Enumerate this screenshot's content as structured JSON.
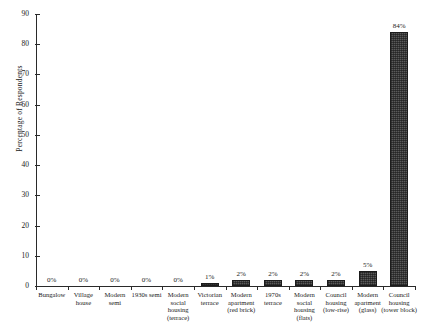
{
  "chart_data": {
    "type": "bar",
    "title": "",
    "xlabel": "",
    "ylabel": "Percentage of Respondents",
    "ylim": [
      0,
      90
    ],
    "ystep": 10,
    "yticks": [
      0,
      10,
      20,
      30,
      40,
      50,
      60,
      70,
      80,
      90
    ],
    "grid": false,
    "legend": null,
    "value_suffix": "%",
    "bar_color": "#5a5a5a",
    "bar_border_color": "#1c1c1c",
    "axis_color": "#2a2a2a",
    "categories": [
      "Bungalow",
      "Village house",
      "Modern semi",
      "1930s semi",
      "Modern social housing (terrace)",
      "Victorian terrace",
      "Modern apartment (red brick)",
      "1970s terrace",
      "Modern social housing (flats)",
      "Council housing (low-rise)",
      "Modern apartment (glass)",
      "Council housing (tower block)"
    ],
    "category_lines": [
      [
        "Bungalow"
      ],
      [
        "Village",
        "house"
      ],
      [
        "Modern",
        "semi"
      ],
      [
        "1930s semi"
      ],
      [
        "Modern",
        "social housing",
        "(terrace)"
      ],
      [
        "Victorian",
        "terrace"
      ],
      [
        "Modern",
        "apartment",
        "(red brick)"
      ],
      [
        "1970s",
        "terrace"
      ],
      [
        "Modern",
        "social housing",
        "(flats)"
      ],
      [
        "Council",
        "housing",
        "(low-rise)"
      ],
      [
        "Modern",
        "apartment",
        "(glass)"
      ],
      [
        "Council",
        "housing",
        "(tower block)"
      ]
    ],
    "values": [
      0,
      0,
      0,
      0,
      0,
      1,
      2,
      2,
      2,
      2,
      5,
      84
    ],
    "data_labels": [
      "0%",
      "0%",
      "0%",
      "0%",
      "0%",
      "1%",
      "2%",
      "2%",
      "2%",
      "2%",
      "5%",
      "84%"
    ]
  }
}
